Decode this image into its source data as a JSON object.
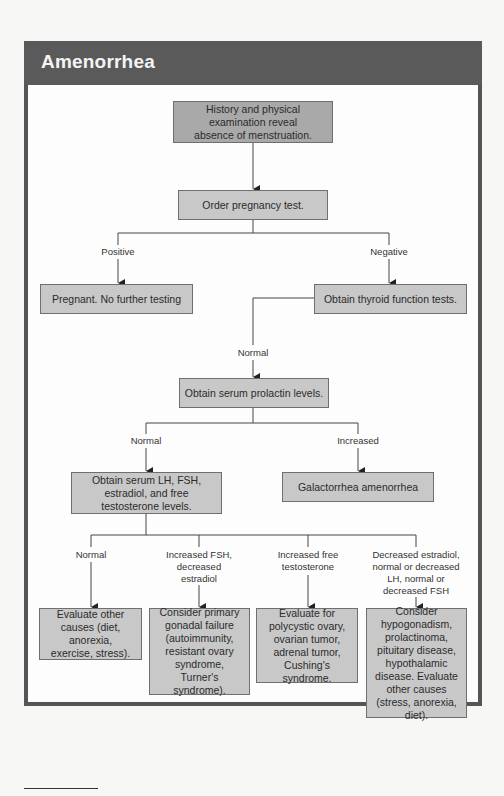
{
  "title": "Amenorrhea",
  "nodes": {
    "start": "History and physical examination reveal absence of menstruation.",
    "pregnancy_test": "Order pregnancy test.",
    "pregnant": "Pregnant. No further testing",
    "thyroid": "Obtain thyroid function tests.",
    "prolactin": "Obtain serum prolactin levels.",
    "hormones": "Obtain serum LH, FSH, estradiol, and free testosterone levels.",
    "galactorrhea": "Galactorrhea amenorrhea",
    "other_causes": "Evaluate other causes (diet, anorexia, exercise, stress).",
    "gonadal_failure": "Consider primary gonadal failure (autoimmunity, resistant ovary syndrome, Turner's syndrome).",
    "polycystic": "Evaluate for polycystic ovary, ovarian tumor, adrenal tumor, Cushing's syndrome.",
    "hypogonadism": "Consider hypogonadism, prolactinoma, pituitary disease, hypothalamic disease. Evaluate other causes (stress, anorexia, diet)."
  },
  "edge_labels": {
    "positive": "Positive",
    "negative": "Negative",
    "thyroid_normal": "Normal",
    "prolactin_normal": "Normal",
    "prolactin_increased": "Increased",
    "hormones_normal": "Normal",
    "hormones_fsh": "Increased FSH, decreased estradiol",
    "hormones_testosterone": "Increased free testosterone",
    "hormones_estradiol": "Decreased estradiol, normal or decreased LH, normal or decreased FSH"
  },
  "colors": {
    "header": "#5a5a5a",
    "box": "#c8c8c8",
    "box_dark": "#a9a9a9",
    "line": "#333333"
  }
}
